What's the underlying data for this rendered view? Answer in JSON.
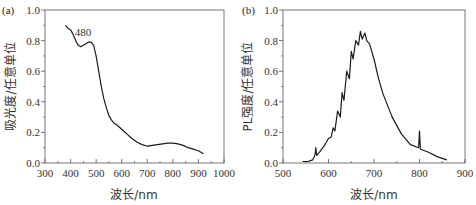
{
  "chart_data": [
    {
      "panel": "(a)",
      "type": "line",
      "title": "",
      "xlabel": "波长/nm",
      "ylabel": "吸光度/任意单位",
      "xlim": [
        300,
        1000
      ],
      "ylim": [
        0.0,
        1.0
      ],
      "xticks": [
        "300",
        "400",
        "500",
        "600",
        "700",
        "800",
        "900",
        "1000"
      ],
      "yticks": [
        "0.0",
        "0.2",
        "0.4",
        "0.6",
        "0.8",
        "1.0"
      ],
      "annotations": [
        {
          "text": "480",
          "x": 480,
          "y": 0.79
        }
      ],
      "grid": false,
      "series": [
        {
          "name": "absorbance",
          "x": [
            380,
            390,
            400,
            410,
            420,
            430,
            440,
            450,
            460,
            470,
            480,
            490,
            500,
            510,
            520,
            530,
            540,
            550,
            560,
            570,
            580,
            600,
            620,
            640,
            660,
            680,
            700,
            720,
            740,
            760,
            780,
            800,
            820,
            840,
            860,
            880,
            900,
            920
          ],
          "y": [
            0.9,
            0.88,
            0.87,
            0.84,
            0.8,
            0.77,
            0.76,
            0.77,
            0.78,
            0.79,
            0.79,
            0.77,
            0.7,
            0.6,
            0.5,
            0.42,
            0.36,
            0.31,
            0.28,
            0.26,
            0.25,
            0.22,
            0.19,
            0.16,
            0.135,
            0.12,
            0.11,
            0.115,
            0.12,
            0.125,
            0.13,
            0.13,
            0.125,
            0.115,
            0.1,
            0.09,
            0.08,
            0.06
          ]
        }
      ]
    },
    {
      "panel": "(b)",
      "type": "line",
      "title": "",
      "xlabel": "波长/nm",
      "ylabel": "PL强度/任意单位",
      "xlim": [
        500,
        900
      ],
      "ylim": [
        0.0,
        1.0
      ],
      "xticks": [
        "500",
        "600",
        "700",
        "800",
        "900"
      ],
      "yticks": [
        "0.0",
        "0.2",
        "0.4",
        "0.6",
        "0.8",
        "1.0"
      ],
      "grid": false,
      "series": [
        {
          "name": "PL intensity",
          "x": [
            543,
            555,
            565,
            570,
            572,
            574,
            580,
            590,
            600,
            606,
            610,
            614,
            620,
            626,
            630,
            634,
            640,
            646,
            650,
            654,
            660,
            666,
            670,
            674,
            680,
            684,
            690,
            700,
            710,
            720,
            740,
            760,
            780,
            798,
            800,
            802,
            820,
            840,
            860
          ],
          "y": [
            0.01,
            0.01,
            0.02,
            0.05,
            0.1,
            0.05,
            0.07,
            0.11,
            0.16,
            0.17,
            0.23,
            0.21,
            0.34,
            0.3,
            0.46,
            0.41,
            0.6,
            0.55,
            0.73,
            0.68,
            0.8,
            0.77,
            0.86,
            0.81,
            0.85,
            0.8,
            0.78,
            0.68,
            0.55,
            0.45,
            0.3,
            0.19,
            0.12,
            0.1,
            0.21,
            0.09,
            0.07,
            0.04,
            0.02
          ]
        }
      ]
    }
  ]
}
